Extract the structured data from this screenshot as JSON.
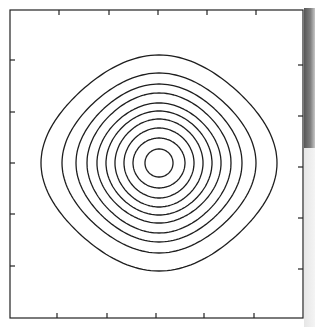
{
  "chart_data": {
    "type": "contour",
    "title": "",
    "xlabel": "",
    "ylabel": "",
    "grid": false,
    "legend": null,
    "frame": {
      "left": 10,
      "top": 10,
      "right": 303,
      "bottom": 318,
      "stroke": "#222222"
    },
    "ticks": {
      "count_per_side": 5,
      "top_x": [
        59,
        109,
        158,
        207,
        256
      ],
      "bottom_x": [
        57,
        107,
        156,
        204,
        254
      ],
      "left_y": [
        60,
        112,
        163,
        214,
        266
      ],
      "right_y": [
        65,
        116,
        167,
        218,
        269
      ],
      "labels": []
    },
    "center": {
      "x": 159,
      "y": 163
    },
    "levels": 10,
    "contours": [
      {
        "level": 10,
        "rx": 14,
        "ry": 14,
        "squareness": 0.0
      },
      {
        "level": 9,
        "rx": 26,
        "ry": 25,
        "squareness": 0.05
      },
      {
        "level": 8,
        "rx": 35,
        "ry": 35,
        "squareness": 0.1
      },
      {
        "level": 7,
        "rx": 44,
        "ry": 44,
        "squareness": 0.15
      },
      {
        "level": 6,
        "rx": 53,
        "ry": 52,
        "squareness": 0.2
      },
      {
        "level": 5,
        "rx": 62,
        "ry": 60,
        "squareness": 0.25
      },
      {
        "level": 4,
        "rx": 72,
        "ry": 70,
        "squareness": 0.3
      },
      {
        "level": 3,
        "rx": 83,
        "ry": 79,
        "squareness": 0.35
      },
      {
        "level": 2,
        "rx": 97,
        "ry": 90,
        "squareness": 0.42
      },
      {
        "level": 1,
        "rx": 118,
        "ry": 108,
        "squareness": 0.5
      }
    ],
    "line_color": "#1e1e1e",
    "line_width": 1.3
  }
}
